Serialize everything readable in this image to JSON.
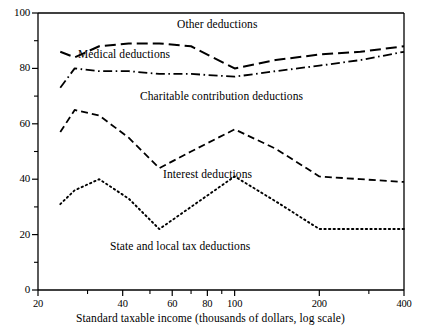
{
  "chart_data": {
    "type": "line",
    "title": "",
    "xlabel": "Standard taxable income (thousands of dollars, log scale)",
    "ylabel": "",
    "xscale": "log",
    "xlim": [
      20,
      400
    ],
    "ylim": [
      0,
      100
    ],
    "grid": false,
    "legend_position": "inline-annotations",
    "x_ticks_major": [
      20,
      40,
      60,
      80,
      100,
      200,
      400
    ],
    "x_tick_labels": [
      "20",
      "40",
      "60",
      "80",
      "100",
      "200",
      "400"
    ],
    "x_ticks_minor": [
      30,
      50,
      70,
      90,
      300
    ],
    "y_ticks_major": [
      0,
      20,
      40,
      60,
      80,
      100
    ],
    "y_tick_labels": [
      "0",
      "20",
      "40",
      "60",
      "80",
      "100"
    ],
    "y_ticks_minor": [
      10,
      30,
      50,
      70,
      90
    ],
    "x": [
      24,
      27,
      33,
      42,
      54,
      70,
      100,
      140,
      200,
      280,
      400
    ],
    "series": [
      {
        "name": "Other deductions",
        "label": "Other deductions",
        "dash": "long-dash",
        "values": [
          86,
          84,
          88,
          89,
          89,
          88,
          80,
          83,
          85,
          86,
          88
        ]
      },
      {
        "name": "Medical deductions",
        "label": "Medical deductions",
        "dash": "dash-dot",
        "values": [
          73,
          80,
          79,
          79,
          78,
          78,
          77,
          79,
          81,
          83,
          86
        ]
      },
      {
        "name": "Charitable contribution deductions",
        "label": "Charitable contribution deductions",
        "dash": "medium-dash",
        "values": [
          57,
          65,
          63,
          55,
          44,
          50,
          58,
          51,
          41,
          40,
          39
        ]
      },
      {
        "name": "State and local tax deductions",
        "label": "State and local tax deductions",
        "dash": "dotted",
        "values": [
          31,
          36,
          40,
          33,
          22,
          30,
          41,
          32,
          22,
          22,
          22
        ]
      }
    ],
    "annotations": [
      {
        "text": "Other deductions",
        "x_px": 177,
        "y_px": 18
      },
      {
        "text": "Medical deductions",
        "x_px": 78,
        "y_px": 48
      },
      {
        "text": "Charitable contribution deductions",
        "x_px": 140,
        "y_px": 90
      },
      {
        "text": "Interest deductions",
        "x_px": 163,
        "y_px": 168
      },
      {
        "text": "State and local tax deductions",
        "x_px": 110,
        "y_px": 240
      }
    ]
  },
  "axis": {
    "x_title": "Standard taxable income (thousands of dollars, log scale)"
  },
  "colors": {
    "line": "#000000",
    "background": "#ffffff",
    "text": "#000000"
  }
}
